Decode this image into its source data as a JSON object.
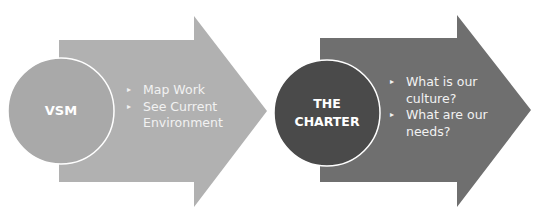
{
  "colors": {
    "arrow1_fill": "#b1b1b1",
    "circle1_fill": "#a9a9a9",
    "arrow2_fill": "#6f6f6f",
    "circle2_fill": "#4a4a4a",
    "circle_stroke": "#ffffff",
    "text": "#ffffff"
  },
  "steps": [
    {
      "title": "VSM",
      "bullets": [
        "Map Work",
        "See Current Environment"
      ],
      "bullet_icon": "triangle-right-icon"
    },
    {
      "title_lines": [
        "THE",
        "CHARTER"
      ],
      "title": "THE CHARTER",
      "bullets": [
        "What is our culture?",
        "What are our needs?"
      ],
      "bullet_icon": "triangle-right-icon"
    }
  ],
  "icons": {
    "bullet": "▸"
  }
}
